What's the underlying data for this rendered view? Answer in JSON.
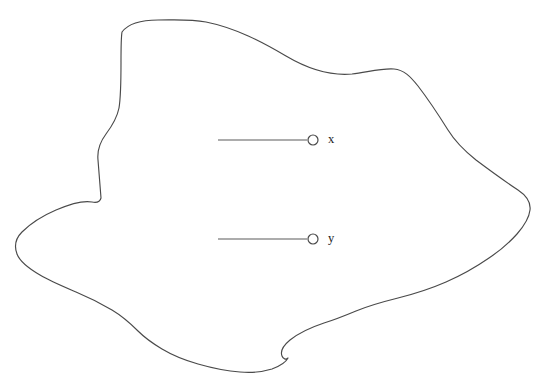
{
  "figure": {
    "background_color": "#ffffff",
    "width": 542,
    "height": 386,
    "outline": {
      "name": "blob-outline",
      "stroke_color": "#4a4a4a",
      "stroke_width": 1.15,
      "fill": "none",
      "closed": true,
      "path": "M 122,32 C 128,24 140,20 158,20 C 176,20 190,19 206,22 C 236,28 262,42 286,56 C 308,69 330,76 352,74 C 368,72 382,68 394,69 C 404,70 410,76 418,86 C 428,99 438,114 448,130 C 456,143 466,152 476,160 C 492,172 506,182 518,190 C 527,196 531,202 530,210 C 529,219 524,226 517,234 C 508,244 498,252 489,258 C 476,267 462,275 446,282 C 430,289 414,294 398,298 C 382,302 368,306 356,311 C 344,316 334,320 324,323 C 312,327 300,332 290,340 C 284,345 280,351 282,356 C 283,359 286,360 288,358 C 286,362 280,366 272,369 C 262,372 250,373 240,372 C 226,371 212,368 198,364 C 184,360 172,355 162,349 C 152,343 144,337 138,331 C 130,323 122,316 112,310 C 100,303 88,297 76,292 C 62,286 50,281 40,275 C 28,268 20,262 17,254 C 14,246 16,238 22,232 C 30,224 42,216 56,210 C 70,204 82,200 92,202 C 97,203 100,202 101,198 C 100,186 99,172 98,160 C 97,150 100,142 106,134 C 112,126 117,118 119,108 C 121,96 121,80 121,62 C 121,48 121,38 122,32 Z"
    },
    "pointers": [
      {
        "name": "pointer-x",
        "label": "x",
        "label_x": 328,
        "label_y": 133,
        "line_x1": 218,
        "line_x2": 307,
        "line_y": 140,
        "dot_cx": 313,
        "dot_cy": 140,
        "dot_r": 5
      },
      {
        "name": "pointer-y",
        "label": "y",
        "label_x": 328,
        "label_y": 232,
        "line_x1": 218,
        "line_x2": 307,
        "line_y": 239,
        "dot_cx": 313,
        "dot_cy": 239,
        "dot_r": 5
      }
    ]
  }
}
